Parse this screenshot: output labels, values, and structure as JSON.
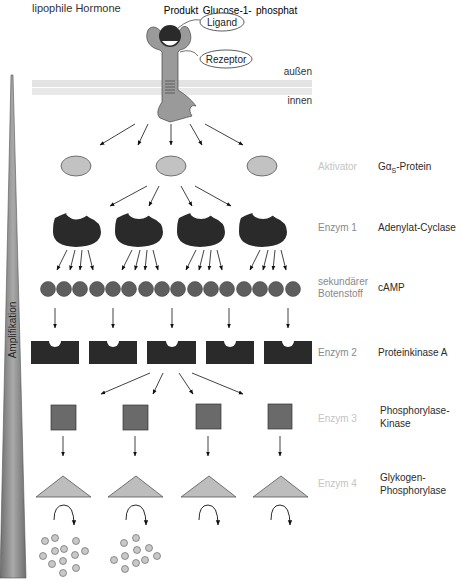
{
  "title": "lipophile Hormone",
  "bubbles": {
    "ligand": "Ligand",
    "receptor": "Rezeptor"
  },
  "membrane": {
    "outside": "außen",
    "inside": "innen"
  },
  "amplification_label": "Amplifikation",
  "rows": [
    {
      "role": "Aktivator",
      "role_style": "faint",
      "name_prefix": "Gα",
      "name_sub": "S",
      "name_suffix": "-Protein",
      "count": 3,
      "shape": "ellipse"
    },
    {
      "role": "Enzym 1",
      "role_style": "mid",
      "name": "Adenylat-Cyclase",
      "count": 4,
      "shape": "notched-oval"
    },
    {
      "role_line1": "sekundärer",
      "role_line2": "Botenstoff",
      "role_style": "mid",
      "name": "cAMP",
      "count": 16,
      "shape": "circle"
    },
    {
      "role": "Enzym 2",
      "role_style": "mid",
      "name": "Proteinkinase A",
      "count": 5,
      "shape": "notched-rect"
    },
    {
      "role": "Enzym 3",
      "role_style": "faint",
      "name_line1": "Phosphorylase-",
      "name_line2": "Kinase",
      "count": 4,
      "shape": "square"
    },
    {
      "role": "Enzym 4",
      "role_style": "faint",
      "name_line1": "Glykogen-",
      "name_line2": "Phosphorylase",
      "count": 4,
      "shape": "triangle"
    },
    {
      "role": "Produkt",
      "role_style": "faint",
      "name_line1": "Glucose-1-",
      "name_line2": "phosphat",
      "count": 4,
      "shape": "dot-cluster"
    }
  ],
  "colors": {
    "receptor": "#999999",
    "ligand": "#2a2a2a",
    "membrane": "#e6e6e6",
    "activator": "#c2c2c2",
    "enzyme_dark": "#2a2a2a",
    "camp": "#5e5e5e",
    "kinase_square": "#6a6a6a",
    "triangle": "#bdbdbd",
    "product_dot": "#c8c8c8",
    "amp_wedge": "#8f8f8f"
  }
}
